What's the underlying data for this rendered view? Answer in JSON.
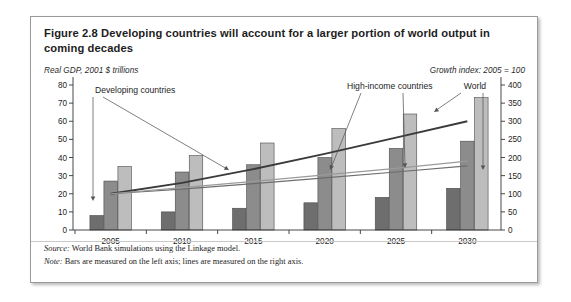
{
  "figure": {
    "title": "Figure 2.8  Developing countries will account for a larger portion of world output in coming decades",
    "left_axis_caption": "Real GDP, 2001 $ trillions",
    "right_axis_caption": "Growth index: 2005 = 100",
    "source_label": "Source:",
    "source_text": " World Bank simulations using the Linkage model.",
    "note_label": "Note:",
    "note_text": " Bars are measured on the left axis; lines are measured on the right axis."
  },
  "chart_data": {
    "type": "bar",
    "title": "Figure 2.8  Developing countries will account for a larger portion of world output in coming decades",
    "xlabel": "",
    "ylabel": "Real GDP, 2001 $ trillions",
    "y2label": "Growth index: 2005 = 100",
    "categories": [
      "2005",
      "2010",
      "2015",
      "2020",
      "2025",
      "2030"
    ],
    "ylim": [
      0,
      80
    ],
    "yticks": [
      0,
      10,
      20,
      30,
      40,
      50,
      60,
      70,
      80
    ],
    "y2lim": [
      0,
      400
    ],
    "y2ticks": [
      0,
      50,
      100,
      150,
      200,
      250,
      300,
      350,
      400
    ],
    "grid": false,
    "legend": "annotations",
    "series": [
      {
        "name": "Developing countries",
        "kind": "bar",
        "axis": "left",
        "color": "#6e6e6e",
        "values": [
          8,
          10,
          12,
          15,
          18,
          23
        ]
      },
      {
        "name": "High-income countries",
        "kind": "bar",
        "axis": "left",
        "color": "#8c8c8c",
        "values": [
          27,
          32,
          36,
          40,
          45,
          49
        ]
      },
      {
        "name": "World",
        "kind": "bar",
        "axis": "left",
        "color": "#bdbdbd",
        "values": [
          35,
          41,
          48,
          56,
          64,
          73
        ]
      },
      {
        "name": "Developing countries",
        "kind": "line",
        "axis": "right",
        "color": "#3a3a3a",
        "values": [
          100,
          130,
          168,
          210,
          255,
          300
        ]
      },
      {
        "name": "High-income countries",
        "kind": "line",
        "axis": "right",
        "color": "#6d6d6d",
        "values": [
          100,
          113,
          128,
          144,
          160,
          177
        ]
      },
      {
        "name": "World",
        "kind": "line",
        "axis": "right",
        "color": "#9a9a9a",
        "values": [
          100,
          117,
          134,
          152,
          170,
          190
        ]
      }
    ],
    "annotations": [
      {
        "text": "Developing countries",
        "target": "developing-bars-and-line"
      },
      {
        "text": "High-income countries",
        "target": "high-income-line"
      },
      {
        "text": "World",
        "target": "world-line"
      }
    ]
  },
  "axes": {
    "left_ticks": [
      "80",
      "70",
      "60",
      "50",
      "40",
      "30",
      "20",
      "10",
      "0"
    ],
    "right_ticks": [
      "400",
      "350",
      "300",
      "250",
      "200",
      "150",
      "100",
      "50",
      "0"
    ],
    "x_ticks": [
      "2005",
      "2010",
      "2015",
      "2020",
      "2025",
      "2030"
    ]
  },
  "annotations": {
    "developing": "Developing countries",
    "high_income": "High-income countries",
    "world": "World"
  }
}
